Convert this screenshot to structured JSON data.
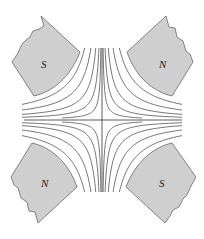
{
  "diagram": {
    "type": "quadrupole-magnetic-field",
    "center": [
      102,
      120
    ],
    "poles": [
      {
        "id": "top-left",
        "label": "S",
        "label_pos": [
          45,
          64
        ]
      },
      {
        "id": "top-right",
        "label": "N",
        "label_pos": [
          163,
          64
        ]
      },
      {
        "id": "bottom-left",
        "label": "N",
        "label_pos": [
          45,
          183
        ]
      },
      {
        "id": "bottom-right",
        "label": "S",
        "label_pos": [
          163,
          183
        ]
      }
    ],
    "field_line_constants": [
      80,
      220,
      450,
      800,
      1250
    ],
    "colors": {
      "pole_fill": "#cfcfcf",
      "pole_stroke": "#6a6a6a",
      "field_line": "#4a4a4a",
      "axis": "#333333"
    }
  }
}
